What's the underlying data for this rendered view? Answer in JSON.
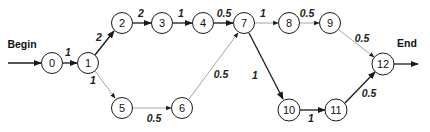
{
  "diagram": {
    "type": "activity-network",
    "start_label": "Begin",
    "end_label": "End",
    "nodes": [
      {
        "id": "0",
        "label": "0",
        "x": 52,
        "y": 63
      },
      {
        "id": "1",
        "label": "1",
        "x": 88,
        "y": 63
      },
      {
        "id": "2",
        "label": "2",
        "x": 122,
        "y": 23
      },
      {
        "id": "3",
        "label": "3",
        "x": 162,
        "y": 23
      },
      {
        "id": "4",
        "label": "4",
        "x": 203,
        "y": 23
      },
      {
        "id": "5",
        "label": "5",
        "x": 122,
        "y": 108
      },
      {
        "id": "6",
        "label": "6",
        "x": 182,
        "y": 108
      },
      {
        "id": "7",
        "label": "7",
        "x": 244,
        "y": 23
      },
      {
        "id": "8",
        "label": "8",
        "x": 289,
        "y": 23
      },
      {
        "id": "9",
        "label": "9",
        "x": 330,
        "y": 23
      },
      {
        "id": "10",
        "label": "10",
        "x": 289,
        "y": 110
      },
      {
        "id": "11",
        "label": "11",
        "x": 336,
        "y": 110
      },
      {
        "id": "12",
        "label": "12",
        "x": 383,
        "y": 64
      }
    ],
    "edges": [
      {
        "from": "0",
        "to": "1",
        "weight": "1",
        "style": "strong"
      },
      {
        "from": "1",
        "to": "2",
        "weight": "2",
        "style": "strong"
      },
      {
        "from": "1",
        "to": "5",
        "weight": "1",
        "style": "light"
      },
      {
        "from": "2",
        "to": "3",
        "weight": "2",
        "style": "strong"
      },
      {
        "from": "3",
        "to": "4",
        "weight": "1",
        "style": "strong"
      },
      {
        "from": "4",
        "to": "7",
        "weight": "0.5",
        "style": "strong"
      },
      {
        "from": "5",
        "to": "6",
        "weight": "0.5",
        "style": "light"
      },
      {
        "from": "6",
        "to": "7",
        "weight": "0.5",
        "style": "light"
      },
      {
        "from": "7",
        "to": "8",
        "weight": "1",
        "style": "light"
      },
      {
        "from": "7",
        "to": "10",
        "weight": "1",
        "style": "strong"
      },
      {
        "from": "8",
        "to": "9",
        "weight": "0.5",
        "style": "light"
      },
      {
        "from": "9",
        "to": "12",
        "weight": "0.5",
        "style": "light"
      },
      {
        "from": "10",
        "to": "11",
        "weight": "1",
        "style": "strong"
      },
      {
        "from": "11",
        "to": "12",
        "weight": "0.5",
        "style": "strong"
      }
    ],
    "weight_labels": {
      "e0_1": "1",
      "e1_2": "2",
      "e1_5": "1",
      "e2_3": "2",
      "e3_4": "1",
      "e4_7": "0.5",
      "e5_6": "0.5",
      "e6_7": "0.5",
      "e7_8": "1",
      "e7_10": "1",
      "e8_9": "0.5",
      "e9_12": "0.5",
      "e10_11": "1",
      "e11_12": "0.5"
    },
    "colors": {
      "strong_edge": "#1a1a1a",
      "light_edge": "#9a9a9a",
      "node_fill": "#ffffff",
      "node_stroke": "#1a1a1a"
    }
  }
}
